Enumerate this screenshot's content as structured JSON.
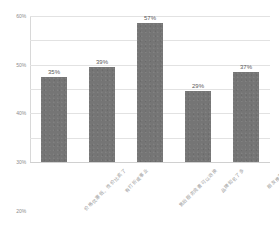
{
  "chart_data": {
    "type": "bar",
    "title": "",
    "subtitle": "",
    "xlabel": "",
    "ylabel": "",
    "categories": [
      "价格优惠低、性价比高了",
      "有打折或事业",
      "售后服务完善可以退换",
      "品牌知名了多",
      "朋友推荐的"
    ],
    "values": [
      35,
      39,
      57,
      29,
      37
    ],
    "value_labels": [
      "35%",
      "39%",
      "57%",
      "29%",
      "37%"
    ],
    "ylim": [
      0,
      60
    ],
    "yticks": [
      0,
      10,
      20,
      30,
      40,
      50,
      60
    ],
    "ytick_labels": [
      "0%",
      "10%",
      "20%",
      "30%",
      "40%",
      "50%",
      "60%"
    ],
    "grid": true,
    "legend": false,
    "legend_position": "none",
    "series": [
      {
        "name": "",
        "values": [
          35,
          39,
          57,
          29,
          37
        ]
      }
    ]
  },
  "style": {
    "bar_color": "#757575",
    "grid_color": "#e2e2e2",
    "axis_color": "#d8d8d8",
    "background": "#ffffff",
    "tick_text_color": "#8c8c8c",
    "value_text_color": "#5a5a5a",
    "category_text_color": "#9a9a9a"
  }
}
